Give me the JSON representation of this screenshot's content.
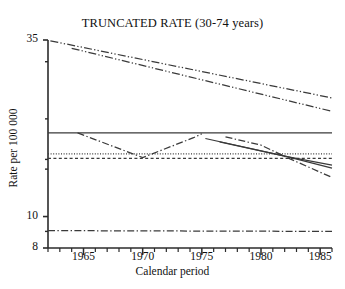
{
  "chart_data": {
    "type": "line",
    "title": "TRUNCATED RATE (30-74 years)",
    "xlabel": "Calendar period",
    "ylabel": "Rate per 100 000",
    "xlim": [
      1962,
      1986
    ],
    "ylim": [
      8,
      35
    ],
    "yscale": "log",
    "grid": false,
    "legend": "none",
    "xticks": [
      1965,
      1970,
      1975,
      1980,
      1985
    ],
    "xtick_labels": [
      "1965",
      "1970",
      "1975",
      "1980",
      "1985"
    ],
    "xminor_ticks": [
      1962,
      1963,
      1964,
      1966,
      1967,
      1968,
      1969,
      1971,
      1972,
      1973,
      1974,
      1976,
      1977,
      1978,
      1979,
      1981,
      1982,
      1983,
      1984,
      1986
    ],
    "yticks": [
      35,
      10,
      8
    ],
    "ytick_labels": [
      "35",
      "10",
      "8"
    ],
    "yminor_ticks": [
      30,
      20,
      15,
      14,
      9
    ],
    "series": [
      {
        "name": "upper-band-a",
        "style": "dash-dot-dot",
        "x": [
          1962.2,
          1986.0
        ],
        "values": [
          34.8,
          23.2
        ]
      },
      {
        "name": "upper-band-b",
        "style": "dash-dot-dot",
        "x": [
          1964.0,
          1986.0
        ],
        "values": [
          33.0,
          21.1
        ]
      },
      {
        "name": "reference-level-solid",
        "style": "solid",
        "x": [
          1962.0,
          1986.0
        ],
        "values": [
          18.1,
          18.1
        ]
      },
      {
        "name": "reference-level-dotted",
        "style": "dotted",
        "x": [
          1962.0,
          1986.0
        ],
        "values": [
          15.6,
          15.6
        ]
      },
      {
        "name": "reference-level-dashed",
        "style": "dashed",
        "x": [
          1962.0,
          1986.0
        ],
        "values": [
          15.1,
          15.1
        ]
      },
      {
        "name": "observed-v-curve",
        "style": "dash-dot",
        "x": [
          1964.5,
          1970.0,
          1974.3,
          1975.0
        ],
        "values": [
          18.1,
          15.2,
          17.5,
          18.0
        ]
      },
      {
        "name": "observed-descending-dashdot",
        "style": "dash-dot",
        "x": [
          1977.0,
          1980.0,
          1982.2,
          1986.0
        ],
        "values": [
          17.6,
          16.6,
          15.2,
          13.2
        ]
      },
      {
        "name": "fitted-trend-solid-a",
        "style": "solid",
        "x": [
          1975.3,
          1982.2,
          1986.0
        ],
        "values": [
          17.4,
          15.3,
          14.4
        ]
      },
      {
        "name": "fitted-trend-solid-b",
        "style": "solid",
        "x": [
          1976.5,
          1982.2,
          1986.0
        ],
        "values": [
          17.0,
          15.3,
          14.1
        ]
      },
      {
        "name": "baseline-dash-dot",
        "style": "dash-dot",
        "x": [
          1962.0,
          1986.0
        ],
        "values": [
          9.05,
          9.0
        ]
      }
    ]
  }
}
